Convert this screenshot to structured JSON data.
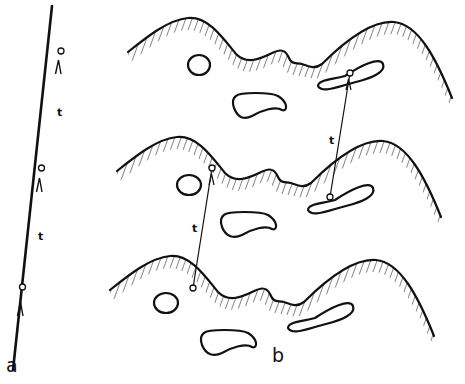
{
  "figure": {
    "panel_a": {
      "label": "a",
      "interval_labels": [
        "t",
        "t"
      ],
      "node_count": 3
    },
    "panel_b": {
      "label": "b",
      "interval_labels": [
        "t",
        "t"
      ],
      "layers": 3
    },
    "colors": {
      "stroke": "#111111",
      "background": "#ffffff"
    }
  }
}
